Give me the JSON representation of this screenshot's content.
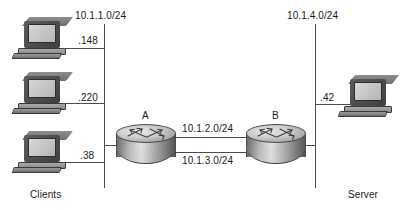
{
  "diagram": {
    "segments": [
      {
        "id": "left-lan",
        "label": "10.1.1.0/24"
      },
      {
        "id": "link-top",
        "label": "10.1.2.0/24"
      },
      {
        "id": "link-bottom",
        "label": "10.1.3.0/24"
      },
      {
        "id": "right-lan",
        "label": "10.1.4.0/24"
      }
    ],
    "routers": [
      {
        "id": "router-a",
        "label": "A"
      },
      {
        "id": "router-b",
        "label": "B"
      }
    ],
    "hosts": [
      {
        "id": "client-1",
        "address": ".148",
        "type": "pc"
      },
      {
        "id": "client-2",
        "address": ".220",
        "type": "pc"
      },
      {
        "id": "client-3",
        "address": ".38",
        "type": "pc"
      },
      {
        "id": "server-1",
        "address": ".42",
        "type": "pc"
      }
    ],
    "groups": [
      {
        "id": "clients-group",
        "label": "Clients"
      },
      {
        "id": "server-group",
        "label": "Server"
      }
    ],
    "colors": {
      "background": "#ffffff",
      "wire": "#4c4c4c",
      "text": "#1a1a1a",
      "device_dark": "#3f3f3f",
      "device_light": "#e2e2e2"
    }
  }
}
